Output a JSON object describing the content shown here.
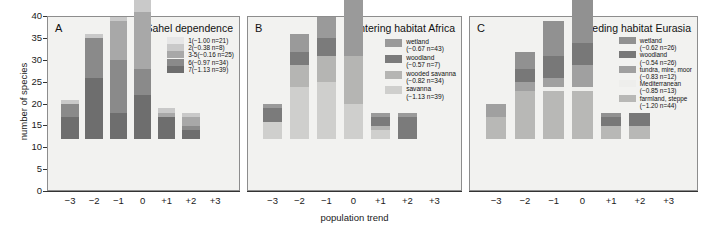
{
  "figure": {
    "ylabel": "number of species",
    "xlabel": "population trend",
    "yticks": [
      "40",
      "35",
      "30",
      "25",
      "20",
      "15",
      "10",
      "5",
      "0"
    ],
    "xticks": [
      "−3",
      "−2",
      "−1",
      "0",
      "+1",
      "+2",
      "+3"
    ]
  },
  "chart_data": [
    {
      "type": "bar",
      "panel": "A",
      "title": "Sahel dependence",
      "stacked": true,
      "grid": false,
      "legend_position": "top-right inside",
      "xlabel": "population trend",
      "ylabel": "number of species",
      "ylim": [
        0,
        40
      ],
      "yticks": [
        0,
        5,
        10,
        15,
        20,
        25,
        30,
        35,
        40
      ],
      "categories": [
        "−3",
        "−2",
        "−1",
        "0",
        "+1",
        "+2",
        "+3"
      ],
      "series": [
        {
          "name": "7(−1.13 n=39)",
          "label": "7(−1.13 n=39)",
          "color": "#6e6e6e",
          "values": [
            5,
            14,
            6,
            10,
            5,
            2,
            0
          ]
        },
        {
          "name": "6(−0.97 n=34)",
          "label": "6(−0.97 n=34)",
          "color": "#8a8a8a",
          "values": [
            3,
            9,
            12,
            6,
            0,
            1,
            0
          ]
        },
        {
          "name": "3-5(−0.16 n=25)",
          "label": "3-5(−0.16 n=25)",
          "color": "#a8a8a8",
          "values": [
            0,
            0,
            9,
            13,
            1,
            2,
            0
          ]
        },
        {
          "name": "2(−0.38 n=8)",
          "label": "2(−0.38 n=8)",
          "color": "#c9c9c9",
          "values": [
            1,
            1,
            1,
            3,
            1,
            1,
            0
          ]
        },
        {
          "name": "1(−1.00 n=21)",
          "label": "1(−1.00 n=21)",
          "color": "#e6e6e6",
          "values": [
            0,
            0,
            0,
            0,
            0,
            0,
            0
          ]
        }
      ],
      "totals": [
        9,
        24,
        28,
        32,
        7,
        6,
        0
      ]
    },
    {
      "type": "bar",
      "panel": "B",
      "title": "wintering habitat Africa",
      "stacked": true,
      "grid": false,
      "legend_position": "top-right inside",
      "xlabel": "population trend",
      "ylabel": "number of species",
      "ylim": [
        0,
        40
      ],
      "categories": [
        "−3",
        "−2",
        "−1",
        "0",
        "+1",
        "+2",
        "+3"
      ],
      "series": [
        {
          "name": "savanna",
          "label": "savanna",
          "sublabel": "(−1.13 n=39)",
          "color": "#cfcfcd",
          "values": [
            4,
            12,
            13,
            8,
            2,
            0,
            0
          ]
        },
        {
          "name": "wooded savanna",
          "label": "wooded savanna",
          "sublabel": "(−0.82 n=34)",
          "color": "#b5b5b3",
          "values": [
            0,
            5,
            6,
            11,
            1,
            0,
            0
          ]
        },
        {
          "name": "woodland",
          "label": "woodland",
          "sublabel": "(−0.57 n=7)",
          "color": "#7b7b7b",
          "values": [
            3,
            3,
            4,
            0,
            2,
            5,
            0
          ]
        },
        {
          "name": "wetland",
          "label": "wetland",
          "sublabel": "(−0.67 n=43)",
          "color": "#9a9a9a",
          "values": [
            1,
            4,
            5,
            13,
            1,
            1,
            0
          ]
        }
      ],
      "totals": [
        8,
        24,
        28,
        32,
        6,
        6,
        0
      ]
    },
    {
      "type": "bar",
      "panel": "C",
      "title": "breeding habitat Eurasia",
      "stacked": true,
      "grid": false,
      "legend_position": "top-right inside",
      "xlabel": "population trend",
      "ylabel": "number of species",
      "ylim": [
        0,
        40
      ],
      "categories": [
        "−3",
        "−2",
        "−1",
        "0",
        "+1",
        "+2",
        "+3"
      ],
      "series": [
        {
          "name": "farmland, steppe",
          "label": "farmland, steppe",
          "sublabel": "(−1.20 n=44)",
          "color": "#b8b8b6",
          "values": [
            5,
            11,
            11,
            11,
            3,
            3,
            0
          ]
        },
        {
          "name": "Mediterranean",
          "label": "Mediterranean",
          "sublabel": "(−0.85 n=13)",
          "color": "#eeeeec",
          "values": [
            0,
            0,
            1,
            1,
            0,
            0,
            0
          ]
        },
        {
          "name": "tundra, mire, moor",
          "label": "tundra, mire, moor",
          "sublabel": "(−0.83 n=12)",
          "color": "#a0a0a0",
          "values": [
            3,
            2,
            2,
            5,
            0,
            0,
            0
          ]
        },
        {
          "name": "woodland",
          "label": "woodland",
          "sublabel": "(−0.54 n=26)",
          "color": "#787878",
          "values": [
            0,
            3,
            5,
            5,
            2,
            3,
            0
          ]
        },
        {
          "name": "wetland",
          "label": "wetland",
          "sublabel": "(−0.62 n=26)",
          "color": "#919191",
          "values": [
            0,
            4,
            8,
            10,
            1,
            0,
            0
          ]
        }
      ],
      "totals": [
        8,
        20,
        27,
        32,
        6,
        6,
        0
      ]
    }
  ]
}
